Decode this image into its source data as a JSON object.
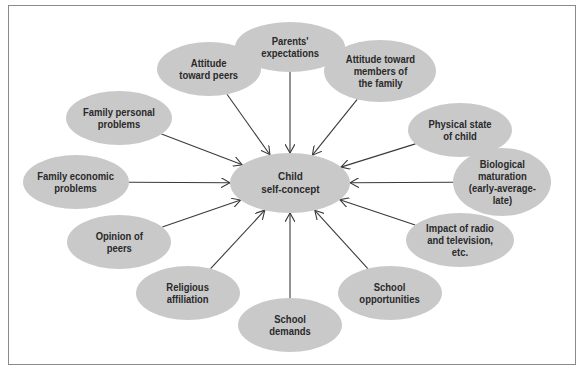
{
  "diagram": {
    "center": {
      "label": "Child\nself-concept",
      "cx": 290,
      "cy": 183,
      "rx": 60,
      "ry": 30
    },
    "nodes": [
      {
        "id": "parents-expectations",
        "label": "Parents'\nexpectations",
        "cx": 290,
        "cy": 47,
        "rx": 55,
        "ry": 25
      },
      {
        "id": "attitude-toward-peers",
        "label": "Attitude\ntoward peers",
        "cx": 209,
        "cy": 69,
        "rx": 52,
        "ry": 27
      },
      {
        "id": "attitude-toward-family",
        "label": "Attitude toward\nmembers of\nthe family",
        "cx": 380,
        "cy": 71,
        "rx": 56,
        "ry": 31
      },
      {
        "id": "family-personal-problems",
        "label": "Family personal\nproblems",
        "cx": 119,
        "cy": 118,
        "rx": 53,
        "ry": 27
      },
      {
        "id": "physical-state",
        "label": "Physical state\nof child",
        "cx": 460,
        "cy": 130,
        "rx": 52,
        "ry": 27
      },
      {
        "id": "family-economic-problems",
        "label": "Family economic\nproblems",
        "cx": 76,
        "cy": 182,
        "rx": 53,
        "ry": 27
      },
      {
        "id": "biological-maturation",
        "label": "Biological\nmaturation\n(early-average-\nlate)",
        "cx": 502,
        "cy": 182,
        "rx": 49,
        "ry": 34
      },
      {
        "id": "opinion-of-peers",
        "label": "Opinion of\npeers",
        "cx": 119,
        "cy": 242,
        "rx": 52,
        "ry": 27
      },
      {
        "id": "impact-radio-tv",
        "label": "Impact of radio\nand television, etc.",
        "cx": 460,
        "cy": 240,
        "rx": 54,
        "ry": 27
      },
      {
        "id": "religious-affiliation",
        "label": "Religious\naffiliation",
        "cx": 188,
        "cy": 293,
        "rx": 52,
        "ry": 27
      },
      {
        "id": "school-demands",
        "label": "School\ndemands",
        "cx": 290,
        "cy": 325,
        "rx": 52,
        "ry": 27
      },
      {
        "id": "school-opportunities",
        "label": "School\nopportunities",
        "cx": 390,
        "cy": 293,
        "rx": 52,
        "ry": 27
      }
    ],
    "colors": {
      "node_fill": "#c9c9c9",
      "text": "#2a2a2a",
      "arrow": "#3a3a3a",
      "frame": "#8a8a8a"
    }
  }
}
